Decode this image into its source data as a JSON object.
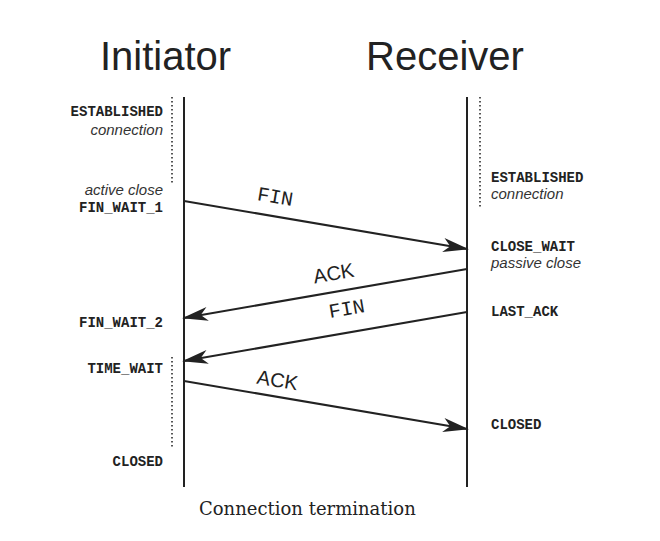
{
  "participants": {
    "initiator": "Initiator",
    "receiver": "Receiver"
  },
  "initiator_states": [
    {
      "state": "ESTABLISHED",
      "note": "connection"
    },
    {
      "state": "FIN_WAIT_1",
      "note": "active close"
    },
    {
      "state": "FIN_WAIT_2"
    },
    {
      "state": "TIME_WAIT"
    },
    {
      "state": "CLOSED"
    }
  ],
  "receiver_states": [
    {
      "state": "ESTABLISHED",
      "note": "connection"
    },
    {
      "state": "CLOSE_WAIT",
      "note": "passive close"
    },
    {
      "state": "LAST_ACK"
    },
    {
      "state": "CLOSED"
    }
  ],
  "messages": [
    {
      "label": "FIN",
      "from": "Initiator",
      "to": "Receiver"
    },
    {
      "label": "ACK",
      "from": "Receiver",
      "to": "Initiator"
    },
    {
      "label": "FIN",
      "from": "Receiver",
      "to": "Initiator"
    },
    {
      "label": "ACK",
      "from": "Initiator",
      "to": "Receiver"
    }
  ],
  "caption": "Connection termination",
  "colors": {
    "line": "#222222",
    "dotted": "#555555",
    "background": "#ffffff"
  }
}
